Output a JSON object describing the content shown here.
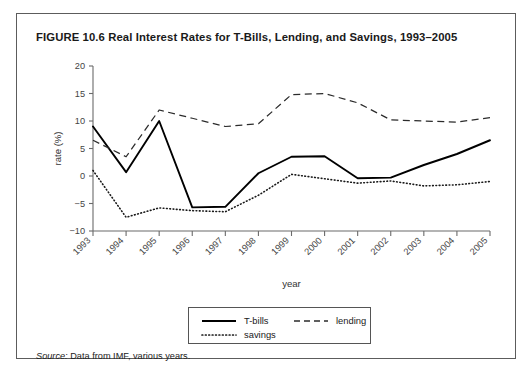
{
  "figure": {
    "title": "FIGURE 10.6  Real Interest Rates for T-Bills, Lending, and Savings, 1993–2005",
    "source_prefix": "Source:",
    "source_text": " Data from IMF, various years."
  },
  "legend": {
    "items": [
      {
        "label": "T-bills",
        "style": "solid",
        "icon": "solid-line-swatch"
      },
      {
        "label": "lending",
        "style": "dashed",
        "icon": "dashed-line-swatch"
      },
      {
        "label": "savings",
        "style": "dotted",
        "icon": "dotted-line-swatch"
      }
    ]
  },
  "chart_data": {
    "type": "line",
    "title": "Real Interest Rates for T-Bills, Lending, and Savings, 1993–2005",
    "xlabel": "year",
    "ylabel": "rate (%)",
    "categories": [
      "1993",
      "1994",
      "1995",
      "1996",
      "1997",
      "1998",
      "1999",
      "2000",
      "2001",
      "2002",
      "2003",
      "2004",
      "2005"
    ],
    "x": [
      1993,
      1994,
      1995,
      1996,
      1997,
      1998,
      1999,
      2000,
      2001,
      2002,
      2003,
      2004,
      2005
    ],
    "xlim": [
      1993,
      2005
    ],
    "ylim": [
      -10,
      20
    ],
    "yticks": [
      -10,
      -5,
      0,
      5,
      10,
      15,
      20
    ],
    "ytick_labels": [
      "−10",
      "−5",
      "0",
      "5",
      "10",
      "15",
      "20"
    ],
    "grid": false,
    "legend_position": "bottom-center",
    "series": [
      {
        "name": "T-bills",
        "style": "solid",
        "values": [
          9.0,
          0.7,
          10.0,
          -5.7,
          -5.6,
          0.5,
          3.5,
          3.6,
          -0.4,
          -0.3,
          2.0,
          4.0,
          6.5
        ]
      },
      {
        "name": "lending",
        "style": "dashed",
        "values": [
          6.5,
          3.5,
          12.0,
          10.5,
          9.0,
          9.5,
          14.8,
          15.0,
          13.3,
          10.2,
          10.0,
          9.8,
          10.6
        ]
      },
      {
        "name": "savings",
        "style": "dotted",
        "values": [
          1.0,
          -7.5,
          -5.8,
          -6.3,
          -6.5,
          -3.5,
          0.3,
          -0.5,
          -1.3,
          -0.9,
          -1.8,
          -1.6,
          -1.0
        ]
      }
    ]
  }
}
